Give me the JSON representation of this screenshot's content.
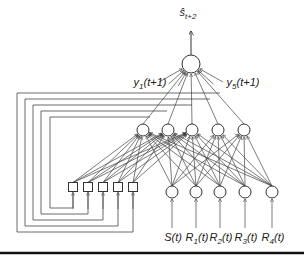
{
  "diagram": {
    "output_label": "ŝ",
    "output_subscript": "t+2",
    "hidden_out_labels": {
      "first": {
        "base": "y",
        "sub": "1",
        "arg": "(t+1)"
      },
      "last": {
        "base": "y",
        "sub": "5",
        "arg": "(t+1)"
      }
    },
    "inputs": [
      {
        "base": "S",
        "sub": "",
        "arg": "(t)"
      },
      {
        "base": "R",
        "sub": "1",
        "arg": "(t)"
      },
      {
        "base": "R",
        "sub": "2",
        "arg": "(t)"
      },
      {
        "base": "R",
        "sub": "3",
        "arg": "(t)"
      },
      {
        "base": "R",
        "sub": "4",
        "arg": "(t)"
      }
    ],
    "layers": {
      "output_nodes": 1,
      "hidden_nodes": 5,
      "input_nodes": 5,
      "context_units": 5
    },
    "colors": {
      "stroke": "#333333",
      "background": "#ffffff",
      "rule": "#111111"
    }
  }
}
